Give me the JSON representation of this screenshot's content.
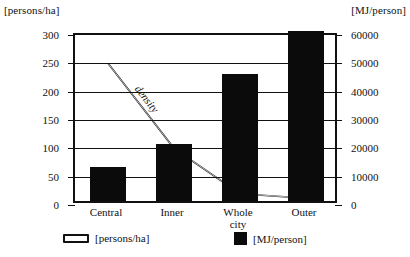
{
  "chart_data": {
    "type": "bar",
    "title": "",
    "categories": [
      "Central",
      "Inner",
      "Whole city",
      "Outer"
    ],
    "series": [
      {
        "name": "[MJ/person]",
        "type": "bar",
        "axis": "right",
        "values": [
          12000,
          20000,
          45000,
          60000
        ],
        "left_axis_equivalent": [
          60,
          100,
          225,
          300
        ],
        "color": "#0b0b0b"
      },
      {
        "name": "density",
        "type": "line",
        "axis": "left",
        "values": [
          250,
          100,
          20,
          12
        ],
        "color": "#111111"
      }
    ],
    "xlabel": "",
    "ylabel_left": "[persons/ha]",
    "ylabel_right": "[MJ/person]",
    "ylim_left": [
      0,
      300
    ],
    "ylim_right": [
      0,
      60000
    ],
    "yticks_left": [
      0,
      50,
      100,
      150,
      200,
      250,
      300
    ],
    "yticks_right": [
      0,
      10000,
      20000,
      30000,
      40000,
      50000,
      60000
    ],
    "grid": true,
    "legend_position": "bottom",
    "annotations": [
      "density"
    ]
  },
  "axes": {
    "left_title": "[persons/ha]",
    "right_title": "[MJ/person]",
    "left_ticks": [
      "300",
      "250",
      "200",
      "150",
      "100",
      "50",
      "0"
    ],
    "right_ticks": [
      "60000",
      "50000",
      "40000",
      "30000",
      "20000",
      "10000",
      "0"
    ]
  },
  "categories": [
    {
      "label": "Central",
      "label_line2": ""
    },
    {
      "label": "Inner",
      "label_line2": ""
    },
    {
      "label": "Whole",
      "label_line2": "city"
    },
    {
      "label": "Outer",
      "label_line2": ""
    }
  ],
  "annotation": {
    "density_label": "density"
  },
  "legend": {
    "items": [
      {
        "label": "[persons/ha]",
        "swatch": "open-rectangle"
      },
      {
        "label": "[MJ/person]",
        "swatch": "solid-square"
      }
    ]
  },
  "colors": {
    "bar": "#0b0b0b",
    "line": "#111111",
    "frame": "#111111",
    "background": "#ffffff"
  }
}
